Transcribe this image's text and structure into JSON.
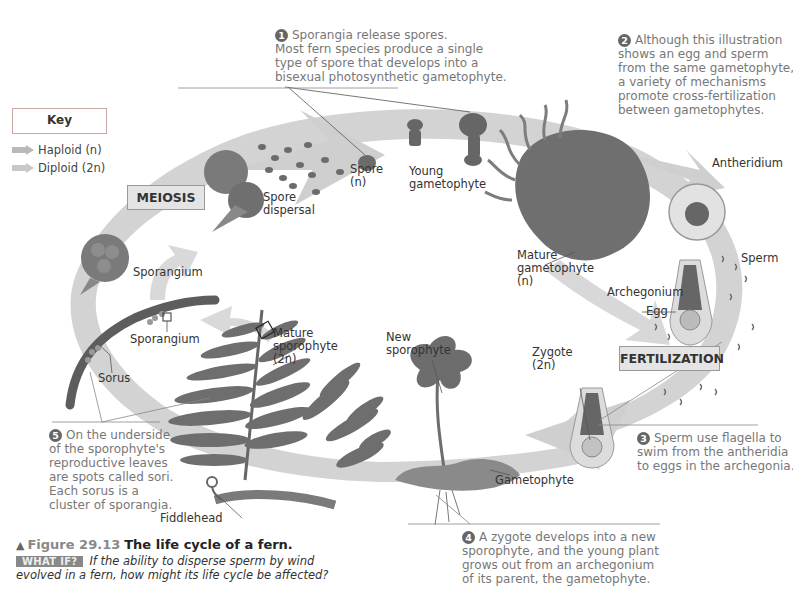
{
  "figure": {
    "number": "Figure 29.13",
    "title": "The life cycle of a fern.",
    "what_if_badge": "WHAT IF?",
    "what_if_question_line1": "If the ability to disperse sperm by wind",
    "what_if_question_line2": "evolved in a fern, how might its life cycle be affected?"
  },
  "key": {
    "title": "Key",
    "items": [
      {
        "label": "Haploid (n)",
        "color": "#b9b9b9"
      },
      {
        "label": "Diploid (2n)",
        "color": "#c8c8c8"
      }
    ]
  },
  "stages": {
    "meiosis": "MEIOSIS",
    "fertilization": "FERTILIZATION"
  },
  "steps": [
    {
      "number": "1",
      "lines": [
        "Sporangia release spores.",
        "Most fern species produce a single",
        "type of spore that develops into a",
        "bisexual photosynthetic gametophyte."
      ]
    },
    {
      "number": "2",
      "lines": [
        "Although this illustration",
        "shows an egg and sperm",
        "from the same gametophyte,",
        "a variety of mechanisms",
        "promote cross-fertilization",
        "between gametophytes."
      ]
    },
    {
      "number": "3",
      "lines": [
        "Sperm use flagella to",
        "swim from the antheridia",
        "to eggs in the archegonia."
      ]
    },
    {
      "number": "4",
      "lines": [
        "A zygote develops into a new",
        "sporophyte, and the young plant",
        "grows out from an archegonium",
        "of its parent, the gametophyte."
      ]
    },
    {
      "number": "5",
      "lines": [
        "On the underside",
        "of the sporophyte's",
        "reproductive leaves",
        "are spots called sori.",
        "Each sorus is a",
        "cluster of sporangia."
      ]
    }
  ],
  "labels": {
    "spore_dispersal": [
      "Spore",
      "dispersal"
    ],
    "spore": [
      "Spore",
      "(n)"
    ],
    "young_gametophyte": [
      "Young",
      "gametophyte"
    ],
    "antheridium": "Antheridium",
    "mature_gametophyte": [
      "Mature",
      "gametophyte",
      "(n)"
    ],
    "sperm": "Sperm",
    "archegonium": "Archegonium",
    "egg": "Egg",
    "zygote": [
      "Zygote",
      "(2n)"
    ],
    "new_sporophyte": [
      "New",
      "sporophyte"
    ],
    "gametophyte": "Gametophyte",
    "mature_sporophyte": [
      "Mature",
      "sporophyte",
      "(2n)"
    ],
    "sporangium_top": "Sporangium",
    "sporangium_leaf": "Sporangium",
    "sorus": "Sorus",
    "fiddlehead": "Fiddlehead"
  },
  "colors": {
    "cycle_band": "#cfcfcf",
    "organism": "#6e6e6e",
    "organism_dark": "#555555",
    "stage_box_fill": "#e4e4e4",
    "step_text": "#777777",
    "key_border": "#c8a7a7"
  }
}
